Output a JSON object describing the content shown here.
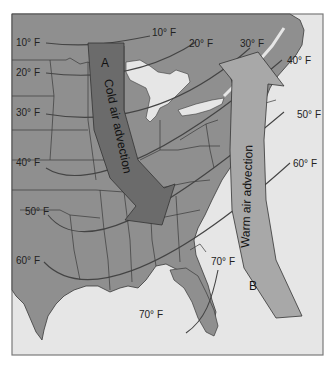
{
  "colors": {
    "land": "#8f8f8f",
    "water": "#e6e6e6",
    "border": "#3a3a3a",
    "frame": "#7a7a7a",
    "isotherm": "#444444",
    "cold_arrow": "#6b6b6b",
    "warm_arrow": "#a8a8a8"
  },
  "isotherms": [
    {
      "label_left": "10° F",
      "label_right": "10° F"
    },
    {
      "label_left": "20° F",
      "label_right": "20° F"
    },
    {
      "label_left": "30° F",
      "label_right": "30° F"
    },
    {
      "label_left": "40° F",
      "label_right": "40° F"
    },
    {
      "label_left": "50° F",
      "label_right": "50° F"
    },
    {
      "label_left": "60° F",
      "label_right": "60° F"
    },
    {
      "label_left": "70° F",
      "label_right": "70° F"
    }
  ],
  "arrows": {
    "cold": {
      "label": "Cold air advection",
      "letter": "A"
    },
    "warm": {
      "label": "Warm air advection",
      "letter": "B"
    }
  }
}
